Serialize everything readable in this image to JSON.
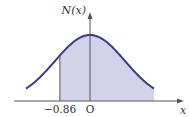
{
  "chart_data": {
    "type": "area",
    "title": "",
    "xlabel": "x",
    "ylabel": "N(x)",
    "curve": "standard normal density",
    "shaded_region": {
      "from": -0.86,
      "to": "right tail (+∞)"
    },
    "tick_labels": [
      "-0.86",
      "O"
    ],
    "colors": {
      "curve": "#3a3a8c",
      "fill": "#d4d2ea",
      "axis": "#555555"
    }
  },
  "labels": {
    "y_axis": "N(x)",
    "x_axis": "x",
    "tick_neg": "−0.86",
    "origin": "O"
  }
}
